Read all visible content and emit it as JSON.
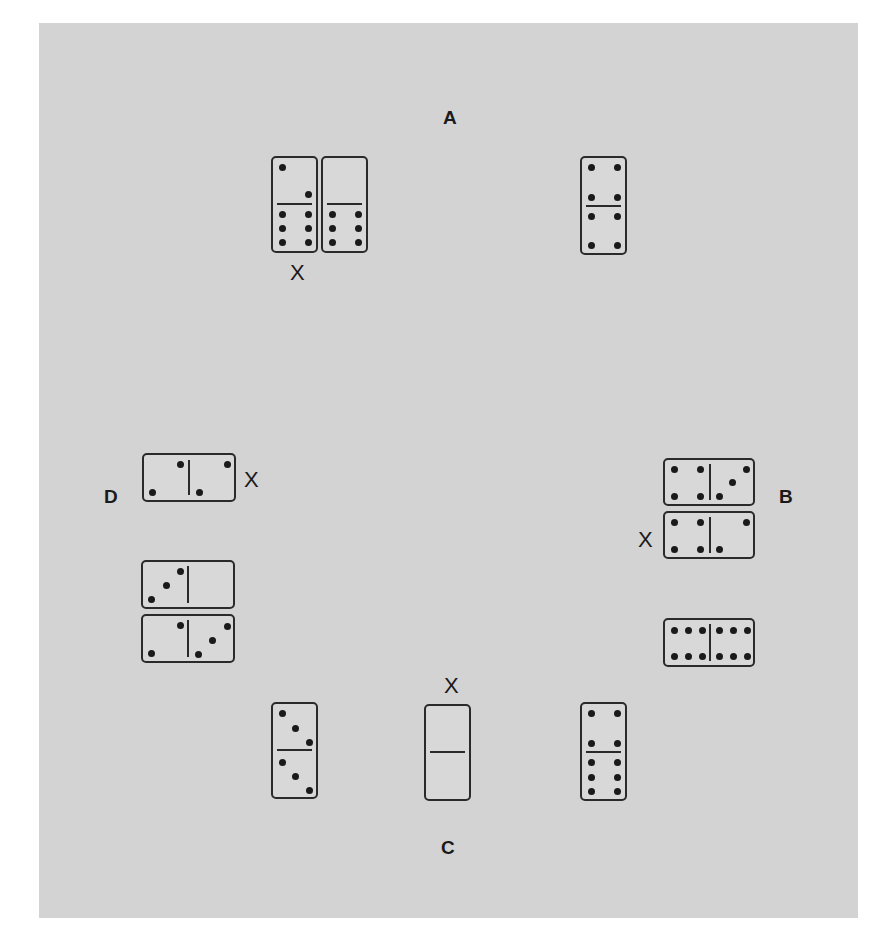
{
  "diagram": {
    "background": "#d3d3d3",
    "players": [
      {
        "id": "A",
        "label": "A",
        "position": "top"
      },
      {
        "id": "B",
        "label": "B",
        "position": "right"
      },
      {
        "id": "C",
        "label": "C",
        "position": "bottom"
      },
      {
        "id": "D",
        "label": "D",
        "position": "left"
      }
    ],
    "marker": "X",
    "dominoes": [
      {
        "id": "a1",
        "owner": "A",
        "orientation": "vertical",
        "ends": [
          2,
          6
        ],
        "marked": true
      },
      {
        "id": "a2",
        "owner": "A",
        "orientation": "vertical",
        "ends": [
          0,
          6
        ],
        "marked": false
      },
      {
        "id": "a3",
        "owner": "A",
        "orientation": "vertical",
        "ends": [
          4,
          4
        ],
        "marked": false
      },
      {
        "id": "b1",
        "owner": "B",
        "orientation": "horizontal",
        "ends": [
          4,
          3
        ],
        "marked": false
      },
      {
        "id": "b2",
        "owner": "B",
        "orientation": "horizontal",
        "ends": [
          4,
          2
        ],
        "marked": true
      },
      {
        "id": "b3",
        "owner": "B",
        "orientation": "horizontal",
        "ends": [
          6,
          6
        ],
        "marked": false
      },
      {
        "id": "c1",
        "owner": "C",
        "orientation": "vertical",
        "ends": [
          3,
          3
        ],
        "marked": false
      },
      {
        "id": "c2",
        "owner": "C",
        "orientation": "vertical",
        "ends": [
          0,
          0
        ],
        "marked": true
      },
      {
        "id": "c3",
        "owner": "C",
        "orientation": "vertical",
        "ends": [
          4,
          6
        ],
        "marked": false
      },
      {
        "id": "d1",
        "owner": "D",
        "orientation": "horizontal",
        "ends": [
          2,
          2
        ],
        "marked": true
      },
      {
        "id": "d2",
        "owner": "D",
        "orientation": "horizontal",
        "ends": [
          3,
          0
        ],
        "marked": false
      },
      {
        "id": "d3",
        "owner": "D",
        "orientation": "horizontal",
        "ends": [
          2,
          3
        ],
        "marked": false
      }
    ]
  }
}
